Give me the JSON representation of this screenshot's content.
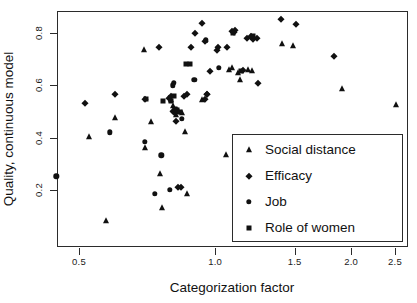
{
  "chart_data": {
    "type": "scatter",
    "title": "",
    "xlabel": "Categorization factor",
    "ylabel": "Quality, continuous model",
    "x_scale": "log",
    "y_scale": "linear",
    "xlim": [
      0.42,
      2.62
    ],
    "ylim": [
      0.06,
      0.88
    ],
    "grid": false,
    "legend_position": "bottom-right",
    "x_ticks": [
      0.5,
      1.0,
      1.5,
      2.0,
      2.5
    ],
    "x_tick_labels": [
      "0.5",
      "1.0",
      "1.5",
      "2.0",
      "2.5"
    ],
    "y_ticks": [
      0.2,
      0.4,
      0.6,
      0.8
    ],
    "y_tick_labels": [
      "0.2",
      "0.4",
      "0.6",
      "0.8"
    ],
    "series": [
      {
        "name": "Social distance",
        "marker": "triangle",
        "color": "#111111",
        "points": [
          [
            0.525,
            0.403
          ],
          [
            0.602,
            0.474
          ],
          [
            0.695,
            0.735
          ],
          [
            0.7,
            0.36
          ],
          [
            0.722,
            0.458
          ],
          [
            0.755,
            0.262
          ],
          [
            0.762,
            0.132
          ],
          [
            0.575,
            0.083
          ],
          [
            0.8,
            0.545
          ],
          [
            0.808,
            0.52
          ],
          [
            0.82,
            0.487
          ],
          [
            0.845,
            0.495
          ],
          [
            0.86,
            0.42
          ],
          [
            0.868,
            0.185
          ],
          [
            0.935,
            0.545
          ],
          [
            1.055,
            0.333
          ],
          [
            1.075,
            0.66
          ],
          [
            1.09,
            0.665
          ],
          [
            1.125,
            0.648
          ],
          [
            1.135,
            0.62
          ],
          [
            1.185,
            0.66
          ],
          [
            1.205,
            0.655
          ],
          [
            1.405,
            0.758
          ],
          [
            1.49,
            0.752
          ],
          [
            1.91,
            0.585
          ],
          [
            2.51,
            0.525
          ]
        ]
      },
      {
        "name": "Efficacy",
        "marker": "diamond",
        "color": "#111111",
        "points": [
          [
            0.515,
            0.532
          ],
          [
            0.6,
            0.568
          ],
          [
            0.7,
            0.548
          ],
          [
            0.752,
            0.745
          ],
          [
            0.79,
            0.552
          ],
          [
            0.8,
            0.558
          ],
          [
            0.805,
            0.503
          ],
          [
            0.812,
            0.498
          ],
          [
            0.818,
            0.462
          ],
          [
            0.828,
            0.21
          ],
          [
            0.84,
            0.212
          ],
          [
            0.852,
            0.558
          ],
          [
            0.868,
            0.568
          ],
          [
            0.885,
            0.745
          ],
          [
            0.905,
            0.8
          ],
          [
            0.935,
            0.838
          ],
          [
            0.948,
            0.77
          ],
          [
            0.952,
            0.548
          ],
          [
            0.958,
            0.565
          ],
          [
            0.962,
            0.568
          ],
          [
            0.975,
            0.655
          ],
          [
            1.01,
            0.735
          ],
          [
            1.015,
            0.748
          ],
          [
            1.06,
            0.745
          ],
          [
            1.09,
            0.808
          ],
          [
            1.1,
            0.805
          ],
          [
            1.105,
            0.812
          ],
          [
            1.15,
            0.66
          ],
          [
            1.175,
            0.78
          ],
          [
            1.2,
            0.79
          ],
          [
            1.215,
            0.778
          ],
          [
            1.235,
            0.782
          ],
          [
            1.245,
            0.61
          ],
          [
            1.4,
            0.852
          ],
          [
            1.51,
            0.835
          ],
          [
            1.835,
            0.712
          ]
        ]
      },
      {
        "name": "Job",
        "marker": "circle",
        "color": "#111111",
        "points": [
          [
            0.445,
            0.252
          ],
          [
            0.585,
            0.42
          ],
          [
            0.7,
            0.385
          ],
          [
            0.735,
            0.185
          ],
          [
            0.76,
            0.332
          ],
          [
            0.795,
            0.2
          ],
          [
            0.805,
            0.6
          ],
          [
            0.81,
            0.61
          ],
          [
            0.82,
            0.505
          ],
          [
            0.828,
            0.5
          ],
          [
            0.845,
            0.472
          ],
          [
            0.9,
            0.62
          ],
          [
            0.955,
            0.772
          ],
          [
            1.02,
            0.668
          ]
        ]
      },
      {
        "name": "Role of women",
        "marker": "square",
        "color": "#111111",
        "points": [
          [
            0.705,
            0.548
          ],
          [
            0.768,
            0.542
          ],
          [
            0.8,
            0.54
          ],
          [
            0.812,
            0.558
          ],
          [
            0.815,
            0.51
          ],
          [
            0.822,
            0.505
          ],
          [
            0.838,
            0.5
          ],
          [
            0.862,
            0.68
          ],
          [
            0.88,
            0.682
          ],
          [
            1.095,
            0.8
          ],
          [
            1.14,
            0.655
          ],
          [
            1.215,
            0.79
          ]
        ]
      }
    ]
  },
  "legend": {
    "items": [
      {
        "label": "Social distance",
        "marker": "triangle"
      },
      {
        "label": "Efficacy",
        "marker": "diamond"
      },
      {
        "label": "Job",
        "marker": "circle"
      },
      {
        "label": "Role of women",
        "marker": "square"
      }
    ]
  }
}
